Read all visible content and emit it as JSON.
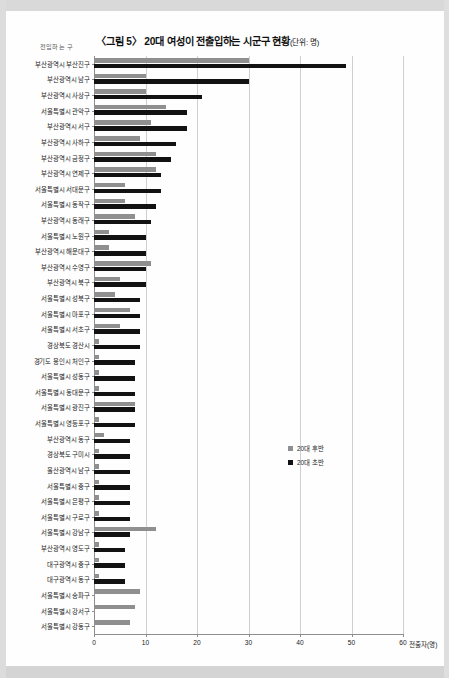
{
  "header": {
    "title_main": "〈그림 5〉 20대 여성이 전출입하는 시군구 현황",
    "title_unit": "(단위: 명)",
    "y_axis_title": "전입하는 구"
  },
  "legend": {
    "position": "inside-right",
    "items": [
      {
        "label": "20대 후반",
        "color": "#8f8f8f"
      },
      {
        "label": "20대 초반",
        "color": "#121212"
      }
    ]
  },
  "axis": {
    "x_title": "전출자(명)",
    "x_ticks": [
      0,
      10,
      20,
      30,
      40,
      50,
      60
    ],
    "x_tick_labels": [
      "0",
      "10",
      "20",
      "30",
      "40",
      "50",
      "60"
    ],
    "x_min": 0,
    "x_max": 60,
    "grid": true
  },
  "chart_data": {
    "type": "bar",
    "orientation": "horizontal",
    "title": "〈그림 5〉 20대 여성이 전출입하는 시군구 현황(단위: 명)",
    "xlabel": "전출자(명)",
    "ylabel": "전입하는 구",
    "xlim": [
      0,
      60
    ],
    "grid": true,
    "legend_position": "inside-right",
    "categories": [
      "부산광역시 부산진구",
      "부산광역시 남구",
      "부산광역시 사상구",
      "서울특별시 관악구",
      "부산광역시 서구",
      "부산광역시 사하구",
      "부산광역시 금정구",
      "부산광역시 연제구",
      "서울특별시 서대문구",
      "서울특별시 동작구",
      "부산광역시 동래구",
      "서울특별시 노원구",
      "부산광역시 해운대구",
      "부산광역시 수영구",
      "부산광역시 북구",
      "서울특별시 성북구",
      "서울특별시 마포구",
      "서울특별시 서초구",
      "경상북도 경산시",
      "경기도 용인시 처인구",
      "서울특별시 성동구",
      "서울특별시 동대문구",
      "서울특별시 광진구",
      "서울특별시 영등포구",
      "부산광역시 동구",
      "경상북도 구미시",
      "울산광역시 남구",
      "서울특별시 중구",
      "서울특별시 은평구",
      "서울특별시 구로구",
      "서울특별시 강남구",
      "부산광역시 영도구",
      "대구광역시 중구",
      "대구광역시 동구",
      "서울특별시 송파구",
      "서울특별시 강서구",
      "서울특별시 강동구"
    ],
    "series": [
      {
        "name": "20대 후반",
        "color": "#8f8f8f",
        "values": [
          30,
          10,
          10,
          14,
          11,
          9,
          12,
          12,
          6,
          6,
          8,
          3,
          3,
          11,
          5,
          4,
          7,
          5,
          1,
          1,
          1,
          1,
          8,
          1,
          2,
          1,
          1,
          1,
          1,
          1,
          12,
          1,
          1,
          1,
          9,
          8,
          7
        ]
      },
      {
        "name": "20대 초반",
        "color": "#121212",
        "values": [
          49,
          30,
          21,
          18,
          18,
          16,
          15,
          13,
          13,
          12,
          11,
          10,
          10,
          10,
          10,
          9,
          9,
          9,
          9,
          8,
          8,
          8,
          8,
          8,
          7,
          7,
          7,
          7,
          7,
          7,
          7,
          6,
          6,
          6,
          0,
          0,
          0
        ]
      }
    ]
  }
}
